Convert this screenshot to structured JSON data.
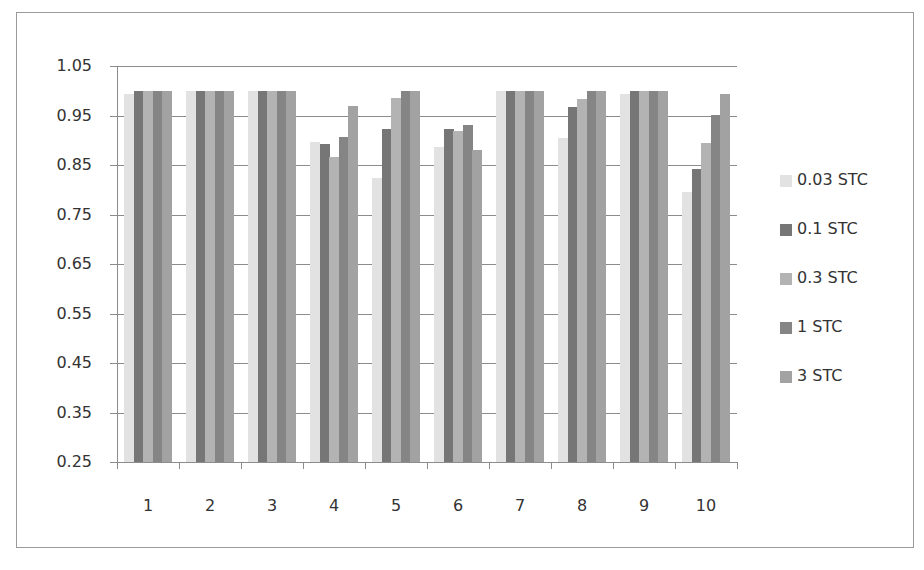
{
  "chart_data": {
    "type": "bar",
    "title": "",
    "xlabel": "",
    "ylabel": "",
    "categories": [
      "1",
      "2",
      "3",
      "4",
      "5",
      "6",
      "7",
      "8",
      "9",
      "10"
    ],
    "y_ticks": [
      "1.05",
      "0.95",
      "0.85",
      "0.75",
      "0.65",
      "0.55",
      "0.45",
      "0.35",
      "0.25"
    ],
    "ylim": [
      0.25,
      1.05
    ],
    "grid": true,
    "legend_position": "right",
    "series": [
      {
        "name": "0.03 STC",
        "color": "#e2e2e2",
        "values": [
          0.994,
          1.0,
          1.0,
          0.896,
          0.823,
          0.886,
          1.0,
          0.904,
          0.994,
          0.796
        ]
      },
      {
        "name": "0.1 STC",
        "color": "#767676",
        "values": [
          1.0,
          1.0,
          1.0,
          0.893,
          0.923,
          0.923,
          1.0,
          0.968,
          1.0,
          0.842
        ]
      },
      {
        "name": "0.3 STC",
        "color": "#b3b3b3",
        "values": [
          1.0,
          1.0,
          1.0,
          0.867,
          0.985,
          0.918,
          1.0,
          0.984,
          1.0,
          0.895
        ]
      },
      {
        "name": "1 STC",
        "color": "#858585",
        "values": [
          1.0,
          1.0,
          1.0,
          0.907,
          1.0,
          0.931,
          1.0,
          1.0,
          1.0,
          0.951
        ]
      },
      {
        "name": "3 STC",
        "color": "#a2a2a2",
        "values": [
          1.0,
          1.0,
          1.0,
          0.97,
          1.0,
          0.881,
          1.0,
          1.0,
          1.0,
          0.994
        ]
      }
    ]
  },
  "legend": {
    "items": [
      {
        "label": "0.03 STC",
        "color": "#e2e2e2"
      },
      {
        "label": "0.1 STC",
        "color": "#767676"
      },
      {
        "label": "0.3 STC",
        "color": "#b3b3b3"
      },
      {
        "label": "1 STC",
        "color": "#858585"
      },
      {
        "label": "3 STC",
        "color": "#a2a2a2"
      }
    ]
  }
}
